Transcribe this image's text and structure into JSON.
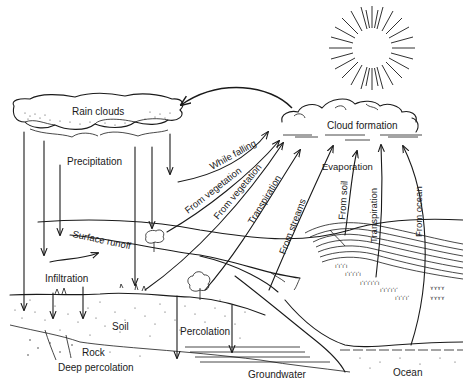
{
  "diagram": {
    "labels": {
      "rain_clouds": "Rain clouds",
      "precipitation": "Precipitation",
      "cloud_formation": "Cloud formation",
      "while_falling": "While falling",
      "from_vegetation_1": "From vegetation",
      "from_vegetation_2": "From vegetation",
      "transpiration_1": "Transpiration",
      "from_streams": "From streams",
      "evaporation": "Evaporation",
      "from_soil": "From soil",
      "transpiration_2": "Transpiration",
      "from_ocean": "From ocean",
      "surface_runoff": "Surface runoff",
      "infiltration": "Infiltration",
      "soil": "Soil",
      "percolation": "Percolation",
      "rock": "Rock",
      "deep_percolation": "Deep percolation",
      "groundwater": "Groundwater",
      "ocean": "Ocean"
    },
    "elements": [
      "sun",
      "rain-clouds",
      "cloud-formation",
      "ground-surface",
      "soil-layer",
      "rock-layer",
      "groundwater",
      "ocean",
      "hill-contours",
      "tree",
      "vegetation",
      "stream"
    ],
    "colors": {
      "ink": "#1a1a1a",
      "background": "#ffffff"
    }
  }
}
